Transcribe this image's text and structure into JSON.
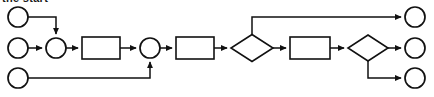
{
  "caption": {
    "text": "the start",
    "note": "clipped at top edge of screenshot"
  },
  "colors": {
    "background": "#ffffff",
    "stroke": "#111111",
    "fill": "#ffffff"
  },
  "canvas": {
    "width": 434,
    "height": 97
  },
  "diagram": {
    "type": "flowchart",
    "orientation": "left-to-right",
    "lanes": [
      17,
      48,
      78
    ],
    "nodes": [
      {
        "id": "start-1",
        "kind": "circle",
        "role": "start-event",
        "label": "",
        "cx": 18,
        "cy": 17,
        "r": 10
      },
      {
        "id": "start-2",
        "kind": "circle",
        "role": "start-event",
        "label": "",
        "cx": 18,
        "cy": 48,
        "r": 10
      },
      {
        "id": "start-3",
        "kind": "circle",
        "role": "start-event",
        "label": "",
        "cx": 18,
        "cy": 78,
        "r": 10
      },
      {
        "id": "merge-1",
        "kind": "circle",
        "role": "merge-node",
        "label": "",
        "cx": 56,
        "cy": 48,
        "r": 10
      },
      {
        "id": "task-1",
        "kind": "rect",
        "role": "task",
        "label": "",
        "x": 82,
        "y": 37,
        "w": 38,
        "h": 22
      },
      {
        "id": "merge-2",
        "kind": "circle",
        "role": "merge-node",
        "label": "",
        "cx": 150,
        "cy": 48,
        "r": 10
      },
      {
        "id": "task-2",
        "kind": "rect",
        "role": "task",
        "label": "",
        "x": 176,
        "y": 37,
        "w": 38,
        "h": 22
      },
      {
        "id": "decision-1",
        "kind": "diamond",
        "role": "decision",
        "label": "",
        "cx": 252,
        "cy": 48,
        "w": 42,
        "h": 27
      },
      {
        "id": "task-3",
        "kind": "rect",
        "role": "task",
        "label": "",
        "x": 290,
        "y": 37,
        "w": 40,
        "h": 22
      },
      {
        "id": "decision-2",
        "kind": "diamond",
        "role": "decision",
        "label": "",
        "cx": 368,
        "cy": 48,
        "w": 40,
        "h": 26
      },
      {
        "id": "end-1",
        "kind": "circle",
        "role": "end-event",
        "label": "",
        "cx": 415,
        "cy": 17,
        "r": 10
      },
      {
        "id": "end-2",
        "kind": "circle",
        "role": "end-event",
        "label": "",
        "cx": 415,
        "cy": 48,
        "r": 10
      },
      {
        "id": "end-3",
        "kind": "circle",
        "role": "end-event",
        "label": "",
        "cx": 415,
        "cy": 78,
        "r": 10
      }
    ],
    "edges": [
      {
        "id": "edge-start1-merge1",
        "from": "start-1",
        "to": "merge-1",
        "label": "",
        "path": "M 28 17 L 56 17 L 56 34",
        "arrow": "down"
      },
      {
        "id": "edge-start2-merge1",
        "from": "start-2",
        "to": "merge-1",
        "label": "",
        "path": "M 28 48 L 42 48",
        "arrow": "right"
      },
      {
        "id": "edge-merge1-task1",
        "from": "merge-1",
        "to": "task-1",
        "label": "",
        "path": "M 66 48 L 78 48",
        "arrow": "right"
      },
      {
        "id": "edge-task1-merge2",
        "from": "task-1",
        "to": "merge-2",
        "label": "",
        "path": "M 120 48 L 136 48",
        "arrow": "right"
      },
      {
        "id": "edge-start3-merge2",
        "from": "start-3",
        "to": "merge-2",
        "label": "",
        "path": "M 28 78 L 150 78 L 150 62",
        "arrow": "up"
      },
      {
        "id": "edge-merge2-task2",
        "from": "merge-2",
        "to": "task-2",
        "label": "",
        "path": "M 160 48 L 172 48",
        "arrow": "right"
      },
      {
        "id": "edge-task2-decision1",
        "from": "task-2",
        "to": "decision-1",
        "label": "",
        "path": "M 214 48 L 227 48",
        "arrow": "right"
      },
      {
        "id": "edge-decision1-end1",
        "from": "decision-1",
        "to": "end-1",
        "label": "",
        "path": "M 252 34 L 252 17 L 401 17",
        "arrow": "right"
      },
      {
        "id": "edge-decision1-task3",
        "from": "decision-1",
        "to": "task-3",
        "label": "",
        "path": "M 273 48 L 286 48",
        "arrow": "right"
      },
      {
        "id": "edge-task3-decision2",
        "from": "task-3",
        "to": "decision-2",
        "label": "",
        "path": "M 330 48 L 344 48",
        "arrow": "right"
      },
      {
        "id": "edge-decision2-end2",
        "from": "decision-2",
        "to": "end-2",
        "label": "",
        "path": "M 388 48 L 401 48",
        "arrow": "right"
      },
      {
        "id": "edge-decision2-end3",
        "from": "decision-2",
        "to": "end-3",
        "label": "",
        "path": "M 368 61 L 368 78 L 401 78",
        "arrow": "right"
      }
    ]
  }
}
